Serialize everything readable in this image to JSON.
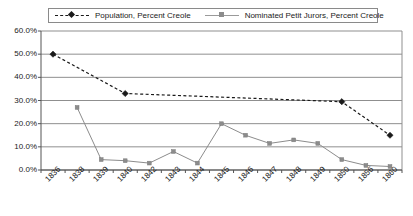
{
  "legend": {
    "position": "top",
    "entries": [
      {
        "label": "Population, Percent Creole",
        "icon": "dashed-diamond-marker",
        "style": "dashed"
      },
      {
        "label": "Nominated Petit Jurors, Percent Creole",
        "icon": "solid-square-marker",
        "style": "solid"
      }
    ]
  },
  "chart_data": {
    "type": "line",
    "title": "",
    "xlabel": "",
    "ylabel": "",
    "ylim": [
      0,
      60
    ],
    "yticks": [
      0,
      10,
      20,
      30,
      40,
      50,
      60
    ],
    "ytick_labels": [
      "0.0%",
      "10.0%",
      "20.0%",
      "30.0%",
      "40.0%",
      "50.0%",
      "60.0%"
    ],
    "grid": true,
    "grid_axis": "y",
    "categories": [
      "1836",
      "1838",
      "1839",
      "1840",
      "1842",
      "1843",
      "1844",
      "1845",
      "1846",
      "1847",
      "1848",
      "1849",
      "1850",
      "1856",
      "1860"
    ],
    "legend_position": "top",
    "series": [
      {
        "name": "Population, Percent Creole",
        "style": "dashed",
        "marker": "diamond",
        "color": "#1a1a1a",
        "values": [
          50.0,
          null,
          null,
          33.0,
          null,
          null,
          null,
          null,
          null,
          null,
          null,
          null,
          29.5,
          null,
          15.0
        ]
      },
      {
        "name": "Nominated Petit Jurors, Percent Creole",
        "style": "solid",
        "marker": "square",
        "color": "#8c8c8c",
        "values": [
          null,
          27.0,
          4.5,
          4.0,
          3.0,
          8.0,
          3.0,
          20.0,
          15.0,
          11.5,
          13.0,
          11.5,
          4.5,
          2.0,
          1.5
        ]
      }
    ]
  },
  "axes": {
    "y_max": 60,
    "y_min": 0
  }
}
